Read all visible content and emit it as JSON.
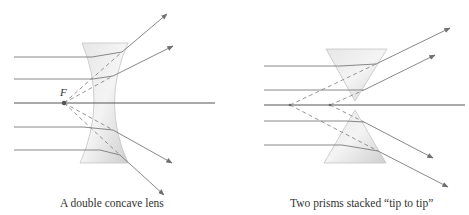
{
  "panels": [
    {
      "id": "concave-lens",
      "caption": "A double concave lens",
      "focal_label": "F",
      "optical_axis": {
        "x1": 14,
        "x2": 215,
        "y": 103
      },
      "focal_point": {
        "x": 64,
        "y": 103
      },
      "incident_rays_y": [
        57,
        79,
        127,
        150
      ],
      "lens": {
        "top_y": 43,
        "bottom_y": 163,
        "left_x": 82,
        "right_x": 128,
        "waist_left_x": 95,
        "waist_right_x": 113
      },
      "refracted_arrows": [
        {
          "from": [
            122,
            52
          ],
          "to": [
            167,
            14
          ]
        },
        {
          "from": [
            113,
            76
          ],
          "to": [
            173,
            46
          ]
        },
        {
          "from": [
            113,
            130
          ],
          "to": [
            172,
            163
          ]
        },
        {
          "from": [
            120,
            155
          ],
          "to": [
            164,
            195
          ]
        }
      ],
      "colors": {
        "ray": "#7a7a7a",
        "lens_fill": "#d9d9d9",
        "dash": "#8a8a8a"
      }
    },
    {
      "id": "two-prisms",
      "caption": "Two prisms stacked “tip to tip”",
      "optical_axis": {
        "x1": 264,
        "x2": 465,
        "y": 105
      },
      "virtual_points": [
        {
          "x": 290,
          "y": 105
        },
        {
          "x": 330,
          "y": 105
        }
      ],
      "incident_rays_y": [
        66,
        90,
        121,
        145
      ],
      "upper_prism": {
        "top_y": 49,
        "left_x": 326,
        "right_x": 387,
        "tip": [
          355,
          101
        ]
      },
      "lower_prism": {
        "bottom_y": 163,
        "left_x": 324,
        "right_x": 386,
        "tip": [
          355,
          110
        ]
      },
      "refracted_arrows": [
        {
          "from": [
            376,
            64
          ],
          "to": [
            450,
            28
          ]
        },
        {
          "from": [
            364,
            90
          ],
          "to": [
            435,
            55
          ]
        },
        {
          "from": [
            364,
            122
          ],
          "to": [
            433,
            158
          ]
        },
        {
          "from": [
            378,
            151
          ],
          "to": [
            448,
            187
          ]
        }
      ],
      "colors": {
        "ray": "#7a7a7a",
        "prism_fill": "#d9d9d9",
        "dash": "#8a8a8a"
      }
    }
  ]
}
